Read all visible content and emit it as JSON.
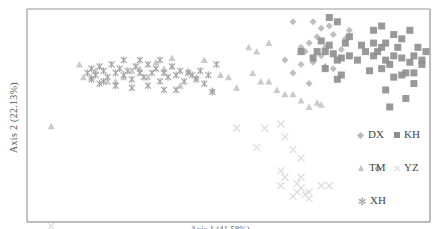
{
  "chart_data": {
    "type": "scatter",
    "title": "",
    "xlabel": "Axis 1 (41.58%)",
    "ylabel": "Axis 2 (22.13%)",
    "xlim": [
      0,
      100
    ],
    "ylim": [
      0,
      100
    ],
    "grid": false,
    "legend_position": "right-inside",
    "legend": [
      {
        "name": "DX",
        "marker": "diamond",
        "color": "#b8b8b8"
      },
      {
        "name": "KH",
        "marker": "square",
        "color": "#8e8e8e"
      },
      {
        "name": "TM",
        "marker": "triangle",
        "color": "#c4c4c4"
      },
      {
        "name": "YZ",
        "marker": "x",
        "color": "#dcdcdc"
      },
      {
        "name": "XH",
        "marker": "star-x",
        "color": "#9a9a9a"
      }
    ],
    "series": [
      {
        "name": "DX",
        "marker": "diamond",
        "color": "#b8b8b8",
        "points": [
          [
            87,
            25
          ],
          [
            70,
            65
          ],
          [
            66,
            70
          ],
          [
            71,
            94
          ],
          [
            66,
            94
          ],
          [
            75,
            92
          ],
          [
            72,
            87
          ],
          [
            70,
            84
          ],
          [
            68,
            82
          ],
          [
            74,
            82
          ],
          [
            78,
            81
          ],
          [
            73,
            78
          ],
          [
            76,
            72
          ],
          [
            74,
            73
          ],
          [
            71,
            75
          ],
          [
            69,
            80
          ],
          [
            76,
            88
          ],
          [
            79,
            86
          ],
          [
            73,
            91
          ],
          [
            80,
            90
          ],
          [
            64,
            76
          ],
          [
            68,
            74
          ]
        ]
      },
      {
        "name": "KH",
        "marker": "square",
        "color": "#8e8e8e",
        "points": [
          [
            75,
            96
          ],
          [
            77,
            94
          ],
          [
            68,
            80
          ],
          [
            71,
            77
          ],
          [
            72,
            80
          ],
          [
            74,
            80
          ],
          [
            76,
            79
          ],
          [
            77,
            76
          ],
          [
            78,
            77
          ],
          [
            80,
            78
          ],
          [
            82,
            76
          ],
          [
            84,
            80
          ],
          [
            86,
            78
          ],
          [
            87,
            80
          ],
          [
            88,
            82
          ],
          [
            89,
            76
          ],
          [
            90,
            74
          ],
          [
            91,
            78
          ],
          [
            92,
            82
          ],
          [
            93,
            77
          ],
          [
            94,
            70
          ],
          [
            95,
            75
          ],
          [
            96,
            78
          ],
          [
            97,
            82
          ],
          [
            98,
            76
          ],
          [
            99,
            80
          ],
          [
            89,
            84
          ],
          [
            86,
            84
          ],
          [
            83,
            83
          ],
          [
            79,
            84
          ],
          [
            75,
            83
          ],
          [
            73,
            85
          ],
          [
            74,
            72
          ],
          [
            78,
            69
          ],
          [
            77,
            67
          ],
          [
            85,
            71
          ],
          [
            88,
            72
          ],
          [
            91,
            68
          ],
          [
            93,
            69
          ],
          [
            96,
            70
          ],
          [
            89,
            62
          ],
          [
            90,
            54
          ],
          [
            94,
            58
          ],
          [
            96,
            65
          ],
          [
            98,
            74
          ],
          [
            93,
            86
          ],
          [
            91,
            88
          ],
          [
            95,
            90
          ],
          [
            86,
            90
          ],
          [
            88,
            92
          ],
          [
            80,
            87
          ]
        ]
      },
      {
        "name": "TM",
        "marker": "triangle",
        "color": "#c4c4c4",
        "points": [
          [
            6,
            45
          ],
          [
            13,
            74
          ],
          [
            14,
            68
          ],
          [
            16,
            68
          ],
          [
            17,
            71
          ],
          [
            20,
            66
          ],
          [
            22,
            66
          ],
          [
            24,
            68
          ],
          [
            26,
            71
          ],
          [
            28,
            72
          ],
          [
            30,
            68
          ],
          [
            32,
            75
          ],
          [
            34,
            72
          ],
          [
            36,
            77
          ],
          [
            38,
            64
          ],
          [
            40,
            71
          ],
          [
            42,
            68
          ],
          [
            44,
            76
          ],
          [
            46,
            62
          ],
          [
            48,
            69
          ],
          [
            50,
            68
          ],
          [
            52,
            63
          ],
          [
            56,
            70
          ],
          [
            58,
            66
          ],
          [
            60,
            66
          ],
          [
            62,
            62
          ],
          [
            64,
            60
          ],
          [
            66,
            60
          ],
          [
            68,
            57
          ],
          [
            70,
            54
          ],
          [
            72,
            56
          ],
          [
            73,
            55
          ],
          [
            57,
            80
          ],
          [
            55,
            82
          ],
          [
            60,
            84
          ]
        ]
      },
      {
        "name": "YZ",
        "marker": "x",
        "color": "#dcdcdc",
        "points": [
          [
            52,
            44
          ],
          [
            59,
            44
          ],
          [
            63,
            46
          ],
          [
            64,
            40
          ],
          [
            57,
            35
          ],
          [
            66,
            34
          ],
          [
            68,
            30
          ],
          [
            63,
            24
          ],
          [
            64,
            21
          ],
          [
            68,
            21
          ],
          [
            63,
            17
          ],
          [
            67,
            18
          ],
          [
            68,
            16
          ],
          [
            70,
            14
          ],
          [
            67,
            14
          ],
          [
            73,
            17
          ],
          [
            75,
            17
          ],
          [
            66,
            12
          ],
          [
            69,
            13
          ],
          [
            70,
            11
          ],
          [
            6,
            -2
          ]
        ]
      },
      {
        "name": "XH",
        "marker": "star-x",
        "color": "#9a9a9a",
        "points": [
          [
            15,
            70
          ],
          [
            16,
            72
          ],
          [
            17,
            69
          ],
          [
            18,
            73
          ],
          [
            19,
            71
          ],
          [
            20,
            68
          ],
          [
            21,
            74
          ],
          [
            22,
            70
          ],
          [
            23,
            72
          ],
          [
            24,
            69
          ],
          [
            25,
            71
          ],
          [
            26,
            67
          ],
          [
            27,
            73
          ],
          [
            28,
            70
          ],
          [
            29,
            68
          ],
          [
            30,
            74
          ],
          [
            31,
            70
          ],
          [
            32,
            72
          ],
          [
            33,
            66
          ],
          [
            34,
            70
          ],
          [
            35,
            68
          ],
          [
            36,
            73
          ],
          [
            37,
            69
          ],
          [
            38,
            71
          ],
          [
            39,
            66
          ],
          [
            40,
            70
          ],
          [
            41,
            69
          ],
          [
            42,
            67
          ],
          [
            43,
            71
          ],
          [
            44,
            65
          ],
          [
            45,
            69
          ],
          [
            46,
            61
          ],
          [
            47,
            74
          ],
          [
            19,
            66
          ],
          [
            22,
            64
          ],
          [
            26,
            63
          ],
          [
            30,
            64
          ],
          [
            34,
            62
          ],
          [
            37,
            62
          ],
          [
            24,
            76
          ],
          [
            28,
            76
          ],
          [
            33,
            76
          ],
          [
            16,
            67
          ],
          [
            18,
            65
          ]
        ]
      }
    ]
  }
}
